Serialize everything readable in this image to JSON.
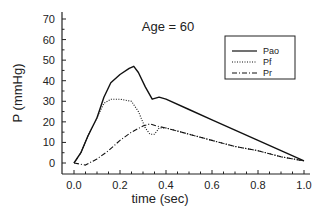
{
  "chart_data": {
    "type": "line",
    "title": "Age = 60",
    "xlabel": "time (sec)",
    "ylabel": "P (mmHg)",
    "xlim": [
      0.0,
      1.0
    ],
    "ylim": [
      0,
      70
    ],
    "xticks": [
      "0.0",
      "0.2",
      "0.4",
      "0.6",
      "0.8",
      "1.0"
    ],
    "yticks": [
      "0",
      "10",
      "20",
      "30",
      "40",
      "50",
      "60",
      "70"
    ],
    "grid": false,
    "legend_position": "upper right",
    "series": [
      {
        "name": "Pao",
        "style": "solid",
        "x": [
          0.0,
          0.03,
          0.06,
          0.1,
          0.13,
          0.16,
          0.2,
          0.24,
          0.26,
          0.28,
          0.31,
          0.34,
          0.37,
          0.4,
          0.5,
          0.6,
          0.7,
          0.8,
          0.9,
          1.0
        ],
        "y": [
          0,
          5,
          13,
          22,
          32,
          39,
          43,
          46,
          47,
          44,
          37,
          31,
          32,
          31,
          26,
          21,
          16,
          11,
          6,
          1
        ]
      },
      {
        "name": "Pf",
        "style": "dotted",
        "x": [
          0.0,
          0.03,
          0.06,
          0.1,
          0.13,
          0.16,
          0.2,
          0.25,
          0.28,
          0.31,
          0.33,
          0.35,
          0.37,
          0.4,
          0.5,
          0.6,
          0.7,
          0.8,
          0.9,
          1.0
        ],
        "y": [
          0,
          5,
          13,
          22,
          29,
          31,
          31,
          30,
          25,
          17,
          14,
          14,
          17,
          17,
          14,
          11,
          8,
          6,
          3,
          1
        ]
      },
      {
        "name": "Pr",
        "style": "dashdot",
        "x": [
          0.0,
          0.05,
          0.1,
          0.15,
          0.2,
          0.25,
          0.3,
          0.33,
          0.36,
          0.4,
          0.5,
          0.6,
          0.7,
          0.8,
          0.9,
          1.0
        ],
        "y": [
          0,
          -1,
          2,
          6,
          11,
          15,
          18,
          19,
          18,
          17,
          14,
          11,
          8,
          6,
          3,
          1
        ]
      }
    ]
  }
}
